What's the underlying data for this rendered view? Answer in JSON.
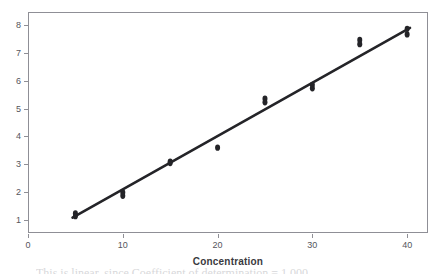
{
  "chart_data": {
    "type": "scatter",
    "title": "",
    "subtitle": "",
    "xlabel": "Concentration",
    "ylabel": "",
    "xlim": [
      0,
      42.2
    ],
    "ylim": [
      0.55,
      8.45
    ],
    "xticks": [
      0,
      10,
      20,
      30,
      40
    ],
    "xtick_labels": [
      "0",
      "10",
      "20",
      "30",
      "40"
    ],
    "yticks": [
      1,
      2,
      3,
      4,
      5,
      6,
      7,
      8
    ],
    "ytick_labels": [
      "1",
      "2",
      "3",
      "4",
      "5",
      "6",
      "7",
      "8"
    ],
    "grid": false,
    "legend": null,
    "legend_position": "none",
    "marker_color": "#242428",
    "marker_shape": "circle",
    "marker_size": 5,
    "series": [
      {
        "name": "Observations",
        "type": "scatter",
        "points": [
          {
            "x": 5,
            "y": 1.25
          },
          {
            "x": 5,
            "y": 1.15
          },
          {
            "x": 10,
            "y": 2.0
          },
          {
            "x": 10,
            "y": 1.88
          },
          {
            "x": 15,
            "y": 3.1
          },
          {
            "x": 15,
            "y": 3.05
          },
          {
            "x": 20,
            "y": 3.6
          },
          {
            "x": 25,
            "y": 5.35
          },
          {
            "x": 25,
            "y": 5.22
          },
          {
            "x": 30,
            "y": 5.85
          },
          {
            "x": 30,
            "y": 5.72
          },
          {
            "x": 35,
            "y": 7.45
          },
          {
            "x": 35,
            "y": 7.3
          },
          {
            "x": 40,
            "y": 7.85
          },
          {
            "x": 40,
            "y": 7.65
          }
        ]
      },
      {
        "name": "Fitted regression line",
        "type": "line",
        "color": "#242428",
        "line_width": 2.6,
        "endpoints": [
          {
            "x": 4.7,
            "y": 1.1
          },
          {
            "x": 40.3,
            "y": 7.88
          }
        ]
      }
    ]
  },
  "axes": {
    "x_axis_title": "Concentration"
  },
  "caption": {
    "text": "This is linear, since Coefficient of determination = 1.000"
  }
}
